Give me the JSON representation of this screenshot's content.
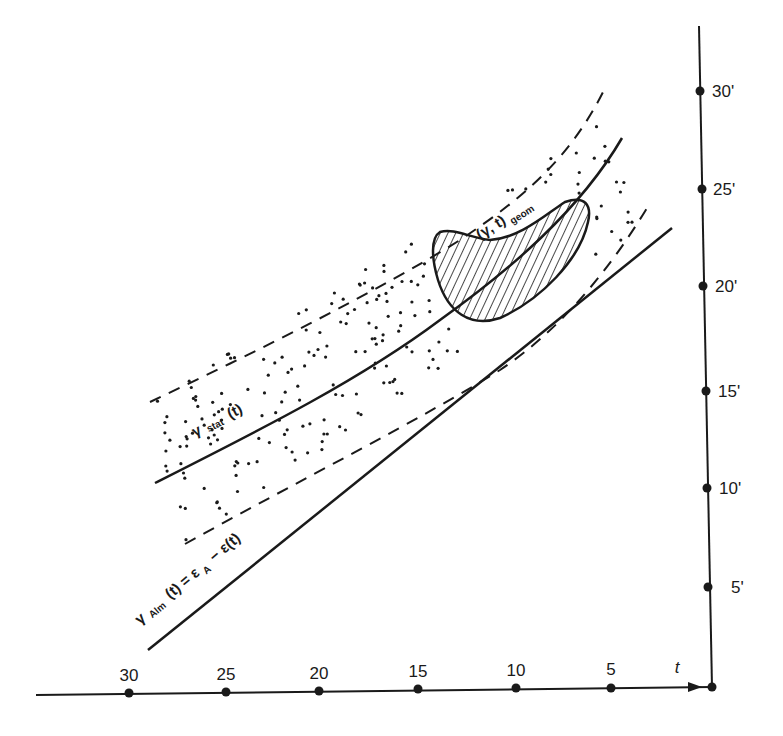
{
  "diagram": {
    "type": "timing diagram",
    "x_axis": {
      "label": "t",
      "ticks": [
        "30",
        "25",
        "20",
        "15",
        "10",
        "5"
      ],
      "direction": "decreasing to the right, arrow pointing right toward origin"
    },
    "y_axis": {
      "ticks": [
        "5'",
        "10'",
        "15'",
        "20'",
        "25'",
        "30'"
      ]
    },
    "curves": {
      "stat": {
        "label_main": "γ",
        "label_sub": "stat",
        "label_arg": "(t)"
      },
      "alm": {
        "label_main": "γ",
        "label_sub": "Alm",
        "label_arg": "(t) = ε",
        "label_sub2": "A",
        "label_tail": "− ε(t)"
      },
      "geom": {
        "label_main": "(γ, t)",
        "label_sub": "geom"
      }
    },
    "band": {
      "style": "dashed boundaries with dotted fill"
    },
    "region": {
      "style": "hatched kidney-shaped region"
    },
    "colors": {
      "ink": "#1a1a1a",
      "background": "#ffffff"
    }
  }
}
